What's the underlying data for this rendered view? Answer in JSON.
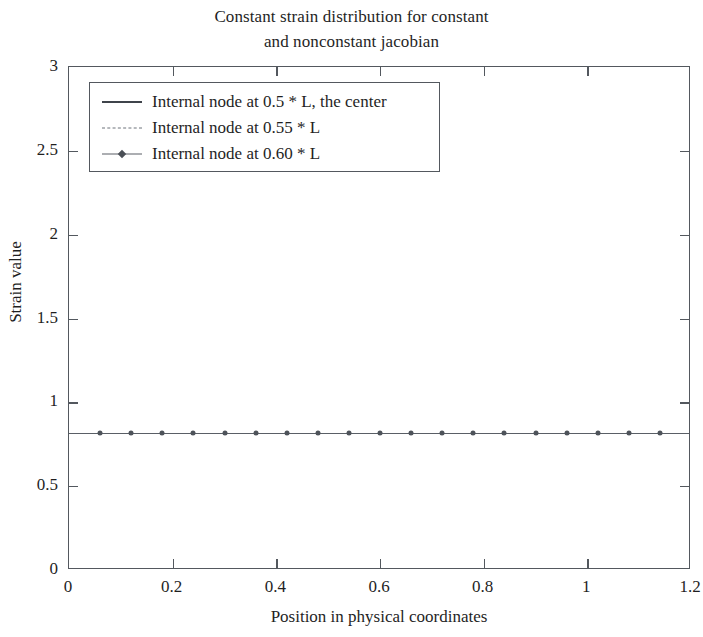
{
  "chart_data": {
    "type": "line",
    "title": "Constant strain distribution for constant and nonconstant jacobian",
    "title_lines": [
      "Constant strain distribution for constant",
      "and nonconstant jacobian"
    ],
    "xlabel": "Position in physical coordinates",
    "ylabel": "Strain value",
    "xlim": [
      0,
      1.2
    ],
    "ylim": [
      0,
      3
    ],
    "xticks": [
      0,
      0.2,
      0.4,
      0.6,
      0.8,
      1,
      1.2
    ],
    "xtick_labels": [
      "0",
      "0.2",
      "0.4",
      "0.6",
      "0.8",
      "1",
      "1.2"
    ],
    "yticks": [
      0,
      0.5,
      1,
      1.5,
      2,
      2.5,
      3
    ],
    "ytick_labels": [
      "0",
      "0.5",
      "1",
      "1.5",
      "2",
      "2.5",
      "3"
    ],
    "grid": false,
    "legend_position": "upper left",
    "x": [
      0,
      0.06,
      0.12,
      0.18,
      0.24,
      0.3,
      0.36,
      0.42,
      0.48,
      0.54,
      0.6,
      0.66,
      0.72,
      0.78,
      0.84,
      0.9,
      0.96,
      1.02,
      1.08,
      1.14,
      1.2
    ],
    "series": [
      {
        "name": "Internal node at 0.5 * L, the center",
        "style": "solid",
        "marker": "none",
        "color": "#4c5158",
        "values": [
          0.82,
          0.82,
          0.82,
          0.82,
          0.82,
          0.82,
          0.82,
          0.82,
          0.82,
          0.82,
          0.82,
          0.82,
          0.82,
          0.82,
          0.82,
          0.82,
          0.82,
          0.82,
          0.82,
          0.82,
          0.82
        ]
      },
      {
        "name": "Internal node at 0.55 * L",
        "style": "dashed",
        "marker": "none",
        "color": "#6d727a",
        "values": [
          0.82,
          0.82,
          0.82,
          0.82,
          0.82,
          0.82,
          0.82,
          0.82,
          0.82,
          0.82,
          0.82,
          0.82,
          0.82,
          0.82,
          0.82,
          0.82,
          0.82,
          0.82,
          0.82,
          0.82,
          0.82
        ]
      },
      {
        "name": "Internal node at 0.60 * L",
        "style": "dashdot",
        "marker": "circle",
        "color": "#5a5f66",
        "values": [
          0.82,
          0.82,
          0.82,
          0.82,
          0.82,
          0.82,
          0.82,
          0.82,
          0.82,
          0.82,
          0.82,
          0.82,
          0.82,
          0.82,
          0.82,
          0.82,
          0.82,
          0.82,
          0.82,
          0.82,
          0.82
        ]
      }
    ],
    "legend_entries": [
      "Internal node at 0.5 * L, the center",
      "Internal node at 0.55 * L",
      "Internal node at 0.60 * L"
    ],
    "axis_color": "#53585e",
    "background_color": "#ffffff"
  }
}
